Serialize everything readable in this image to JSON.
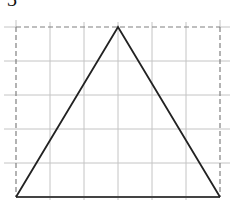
{
  "figure": {
    "label": "3",
    "grid": {
      "columns": 6,
      "rows": 5,
      "cell_size_px": 34,
      "origin_px": [
        16,
        27
      ],
      "grid_color": "#bdbdbd",
      "frame_color": "#777777"
    },
    "triangle": {
      "vertices_grid": [
        [
          0,
          5
        ],
        [
          3,
          0
        ],
        [
          6,
          5
        ]
      ],
      "stroke_color": "#222222",
      "base_color": "#444444"
    }
  }
}
